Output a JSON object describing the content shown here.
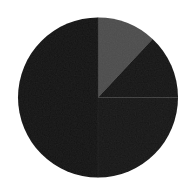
{
  "chart_data": {
    "type": "pie",
    "title": "",
    "xlabel": "",
    "ylabel": "",
    "grid": false,
    "legend_position": "none",
    "start_angle_deg": 0,
    "direction": "clockwise",
    "center": {
      "x": 98,
      "y": 97.5
    },
    "radius": 80,
    "background_color": "#ffffff",
    "categories": [
      "Slice 1",
      "Slice 2",
      "Slice 3",
      "Slice 4"
    ],
    "values": [
      12,
      13,
      25,
      50
    ],
    "percentages": [
      "12%",
      "13%",
      "25%",
      "50%"
    ],
    "colors": [
      "#4d4d4d",
      "#161616",
      "#171717",
      "#141414"
    ],
    "slices": [
      {
        "label": "Slice 1",
        "value": 12,
        "percent": "12%",
        "color": "#4d4d4d",
        "start_deg": 0,
        "end_deg": 43
      },
      {
        "label": "Slice 2",
        "value": 13,
        "percent": "13%",
        "color": "#161616",
        "start_deg": 43,
        "end_deg": 90
      },
      {
        "label": "Slice 3",
        "value": 25,
        "percent": "25%",
        "color": "#171717",
        "start_deg": 90,
        "end_deg": 180
      },
      {
        "label": "Slice 4",
        "value": 50,
        "percent": "50%",
        "color": "#141414",
        "start_deg": 180,
        "end_deg": 360
      }
    ],
    "annotations": []
  }
}
